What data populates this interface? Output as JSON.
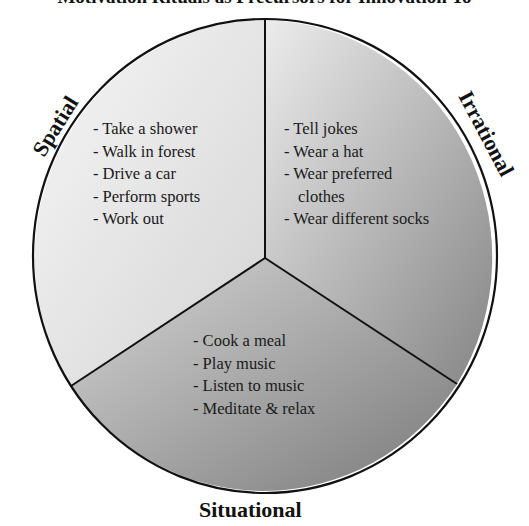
{
  "title": "Motivation Rituals as Precursors for Innovation To",
  "colors": {
    "outline": "#111111",
    "spatial_fill_light": "#f4f4f4",
    "spatial_fill_dark": "#dcdcdc",
    "irrational_fill_light": "#e6e6e6",
    "irrational_fill_dark": "#8e8e8e",
    "situational_fill_light": "#cfcfcf",
    "situational_fill_dark": "#7d7d7d"
  },
  "segments": [
    {
      "label": "Spatial",
      "items": [
        "- Take a shower",
        "- Walk in forest",
        "- Drive a car",
        "- Perform sports",
        "- Work out"
      ]
    },
    {
      "label": "Irrational",
      "items": [
        "- Tell jokes",
        "- Wear a hat",
        "- Wear preferred",
        "clothes",
        "- Wear different socks"
      ]
    },
    {
      "label": "Situational",
      "items": [
        "- Cook a meal",
        "- Play music",
        "- Listen to music",
        "- Meditate & relax"
      ]
    }
  ]
}
